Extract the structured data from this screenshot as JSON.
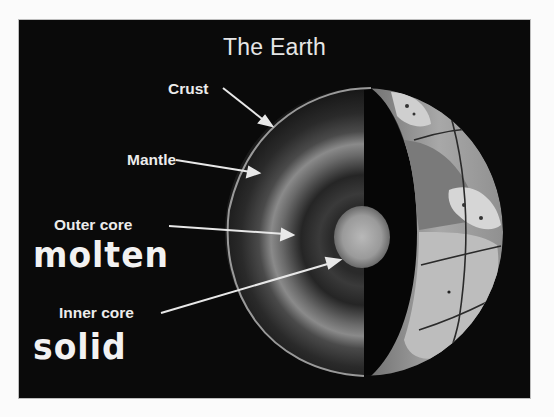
{
  "diagram": {
    "title": "The Earth",
    "layers": [
      {
        "id": "crust",
        "label": "Crust",
        "state": ""
      },
      {
        "id": "mantle",
        "label": "Mantle",
        "state": ""
      },
      {
        "id": "outer_core",
        "label": "Outer core",
        "state": "molten"
      },
      {
        "id": "inner_core",
        "label": "Inner core",
        "state": "solid"
      }
    ],
    "colors": {
      "background": "#0a0a0a",
      "page": "#fbfbfb",
      "text": "#ececec",
      "arrow": "#e8e8e8",
      "land": "#c8c8c8",
      "ocean": "#8a8a8a"
    }
  }
}
